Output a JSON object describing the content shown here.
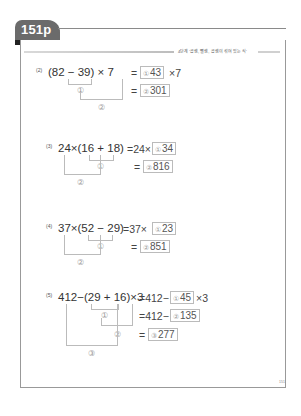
{
  "header": {
    "tab_label": "151p",
    "section_text": "4단계 '곱셈, 뺄셈, 곱셈이 섞여 있는 식'"
  },
  "problems": [
    {
      "number": "(2)",
      "expression": "(82 − 39)  ×  7",
      "step1_prefix": "=",
      "step1_answer": "43",
      "step1_label": "①",
      "step1_suffix": "×7",
      "step2_prefix": "=",
      "step2_answer": "301",
      "step2_label": "②",
      "bracket_labels": [
        "①",
        "②"
      ]
    },
    {
      "number": "(3)",
      "expression": "24×(16  + 18)",
      "step1_prefix": "=24×",
      "step1_answer": "34",
      "step1_label": "①",
      "step2_prefix": "=",
      "step2_answer": "816",
      "step2_label": "②",
      "bracket_labels": [
        "①",
        "②"
      ]
    },
    {
      "number": "(4)",
      "expression": "37×(52 − 29)",
      "step1_prefix": "=37×",
      "step1_answer": "23",
      "step1_label": "①",
      "step2_prefix": "=",
      "step2_answer": "851",
      "step2_label": "②",
      "bracket_labels": [
        "①",
        "②"
      ]
    },
    {
      "number": "(5)",
      "expression": "412−(29  + 16)×3",
      "step1_prefix": "=412−",
      "step1_answer": "45",
      "step1_label": "①",
      "step1_suffix": "×3",
      "step2_prefix": "=412−",
      "step2_answer": "135",
      "step2_label": "②",
      "step3_prefix": "=",
      "step3_answer": "277",
      "step3_label": "③",
      "bracket_labels": [
        "①",
        "②",
        "③"
      ]
    }
  ],
  "footer": {
    "page_number": "151"
  }
}
